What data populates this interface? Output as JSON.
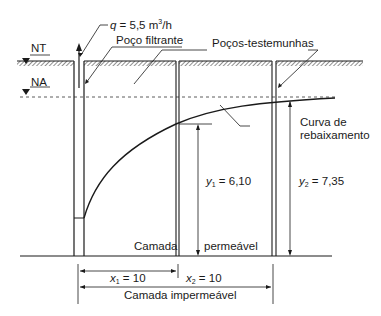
{
  "diagram": {
    "type": "well pumping drawdown cross-section",
    "labels": {
      "flow_rate_var": "q",
      "flow_rate_value": " = 5,5 m",
      "flow_rate_exp": "3",
      "flow_rate_unit": "/h",
      "nt": "NT",
      "na": "NA",
      "pumping_well": "Poço filtrante",
      "observation_wells": "Poços-testemunhas",
      "curve_line1": "Curva de",
      "curve_line2": "rebaixamento",
      "y1_var": "y",
      "y1_sub": "1",
      "y1_value": " = 6,10",
      "y2_var": "y",
      "y2_sub": "2",
      "y2_value": " = 7,35",
      "layer_left": "Camada",
      "layer_right": "permeável",
      "x1_var": "x",
      "x1_sub": "1",
      "x1_value": " = 10",
      "x2_var": "x",
      "x2_sub": "2",
      "x2_value": " = 10",
      "impermeable": "Camada impermeável"
    },
    "values": {
      "q_m3_per_h": 5.5,
      "y1": 6.1,
      "y2": 7.35,
      "x1": 10,
      "x2": 10
    },
    "colors": {
      "line": "#1a1a1a",
      "hatch": "#555555",
      "background": "#ffffff"
    }
  }
}
